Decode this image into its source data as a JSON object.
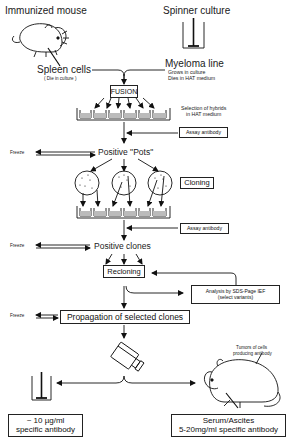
{
  "sources": {
    "left_label": "Immunized mouse",
    "right_label": "Spinner culture"
  },
  "cells": {
    "spleen": "Spleen cells",
    "spleen_note": "( Die in culture )",
    "myeloma": "Myeloma line",
    "myeloma_note1": "Grows in culture",
    "myeloma_note2": "Dies in HAT medium"
  },
  "steps": {
    "fusion": "FUSION",
    "selection_line1": "Selection of hybrids",
    "selection_line2": "in HAT medium",
    "assay1": "Assay antibody",
    "freeze1": "Freeze",
    "positive_pots": "Positive \"Pots\"",
    "cloning": "Cloning",
    "assay2": "Assay antibody",
    "freeze2": "Freeze",
    "positive_clones": "Positive clones",
    "recloning": "Recloning",
    "analysis_line1": "Analysis by SDS-Page IEF",
    "analysis_line2": "(select variants)",
    "freeze3": "Freeze",
    "propagation": "Propagation of selected clones"
  },
  "outputs": {
    "tumor_note1": "Tumors of cells",
    "tumor_note2": "producing antibody",
    "culture_line1": "~ 10 µg/ml",
    "culture_line2": "specific antibody",
    "serum_line1": "Serum/Ascites",
    "serum_line2": "5-20mg/ml specific antibody"
  }
}
